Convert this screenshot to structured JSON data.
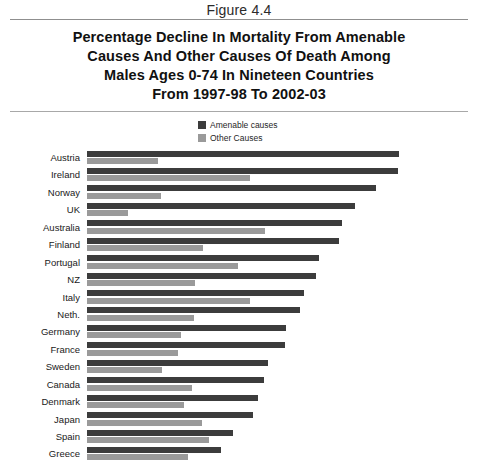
{
  "figure": {
    "caption": "Figure 4.4",
    "title_lines": [
      "Percentage Decline In Mortality From Amenable",
      "Causes And Other Causes Of Death Among",
      "Males Ages 0-74 In Nineteen Countries",
      "From 1997-98 To 2002-03"
    ]
  },
  "legend": {
    "position": "top-center",
    "items": [
      {
        "label": "Amenable causes",
        "color": "#3c3c3c"
      },
      {
        "label": "Other Causes",
        "color": "#9a9a9a"
      }
    ]
  },
  "colors": {
    "amenable": "#3c3c3c",
    "other": "#9a9a9a",
    "rule": "#8f8f8f",
    "background": "#ffffff",
    "text": "#1a1a1a"
  },
  "chart_data": {
    "type": "bar",
    "orientation": "horizontal",
    "title": "Percentage Decline In Mortality From Amenable Causes And Other Causes Of Death Among Males Ages 0-74 In Nineteen Countries From 1997-98 To 2002-03",
    "xlabel": "Percentage decline",
    "ylabel": "",
    "xlim": [
      0,
      40
    ],
    "grid": false,
    "legend_position": "top-center",
    "categories": [
      "Austria",
      "Ireland",
      "Norway",
      "UK",
      "Australia",
      "Finland",
      "Portugal",
      "NZ",
      "Italy",
      "Neth.",
      "Germany",
      "France",
      "Sweden",
      "Canada",
      "Denmark",
      "Japan",
      "Spain",
      "Greece"
    ],
    "series": [
      {
        "name": "Amenable causes",
        "color": "#3c3c3c",
        "values": [
          33.4,
          33.3,
          30.9,
          28.7,
          27.3,
          26.9,
          24.8,
          24.5,
          23.2,
          22.8,
          21.3,
          21.2,
          19.4,
          18.9,
          18.3,
          17.8,
          15.6,
          14.3
        ]
      },
      {
        "name": "Other Causes",
        "color": "#9a9a9a",
        "values": [
          7.6,
          17.4,
          7.9,
          4.4,
          19.0,
          12.4,
          16.1,
          11.5,
          17.4,
          11.4,
          10.1,
          9.7,
          8.0,
          11.2,
          10.4,
          12.3,
          13.0,
          10.8
        ]
      }
    ]
  }
}
